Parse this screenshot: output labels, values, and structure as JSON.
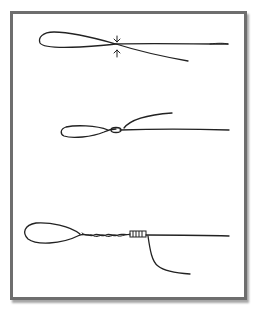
{
  "figure": {
    "stroke_color": "#222222",
    "frame_color": "#6e6e6e",
    "background": "#ffffff",
    "steps": [
      {
        "step": 1,
        "label": "Line doubled to form loop; crossing point marked by two arrows",
        "icon": "arrow-pair-icon"
      },
      {
        "step": 2,
        "label": "Loop with tag end passed through and wrapped once",
        "icon": "loop-icon"
      },
      {
        "step": 3,
        "label": "Twisted loop with barrel wraps; tag end trailing downward",
        "icon": "barrel-wrap-icon"
      }
    ]
  }
}
